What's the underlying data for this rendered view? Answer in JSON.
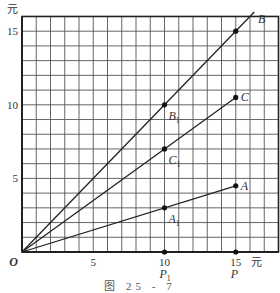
{
  "chart_data": {
    "type": "line",
    "title": "",
    "caption": "图 25 - 7",
    "xlabel": "元",
    "ylabel": "元",
    "origin_label": "O",
    "xlim": [
      0,
      18
    ],
    "ylim": [
      0,
      16
    ],
    "grid": true,
    "grid_step": 1,
    "x_ticks": [
      {
        "value": 5,
        "label": "5"
      },
      {
        "value": 10,
        "label": "10"
      },
      {
        "value": 15,
        "label": "15"
      }
    ],
    "y_ticks": [
      {
        "value": 5,
        "label": "5"
      },
      {
        "value": 10,
        "label": "10"
      },
      {
        "value": 15,
        "label": "15"
      }
    ],
    "axis_points": [
      {
        "name": "P1",
        "label": "P",
        "sub": "1",
        "x": 10,
        "y": 0
      },
      {
        "name": "P",
        "label": "P",
        "sub": "",
        "x": 15,
        "y": 0
      }
    ],
    "series": [
      {
        "name": "B",
        "slope": 1.0,
        "x": [
          0,
          16.3
        ],
        "y": [
          0,
          16.3
        ],
        "points": [
          {
            "label": "B",
            "sub": "1",
            "x": 10,
            "y": 10
          },
          {
            "label": "B",
            "sub": "",
            "x": 15,
            "y": 15
          }
        ],
        "end_label": "B"
      },
      {
        "name": "C",
        "slope": 0.7,
        "x": [
          0,
          15
        ],
        "y": [
          0,
          10.5
        ],
        "points": [
          {
            "label": "C",
            "sub": "1",
            "x": 10,
            "y": 7
          },
          {
            "label": "C",
            "sub": "",
            "x": 15,
            "y": 10.5
          }
        ],
        "end_label": "C"
      },
      {
        "name": "A",
        "slope": 0.3,
        "x": [
          0,
          15
        ],
        "y": [
          0,
          4.5
        ],
        "points": [
          {
            "label": "A",
            "sub": "1",
            "x": 10,
            "y": 3
          },
          {
            "label": "A",
            "sub": "",
            "x": 15,
            "y": 4.5
          }
        ],
        "end_label": "A"
      }
    ],
    "colors": {
      "line": "#222222",
      "grid": "#555555",
      "border": "#222222"
    }
  }
}
